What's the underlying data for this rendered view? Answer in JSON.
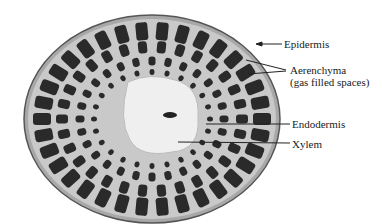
{
  "figure": {
    "labels": [
      {
        "id": "epidermis",
        "text": "Epidermis"
      },
      {
        "id": "aerenchyma",
        "text": "Aerenchyma"
      },
      {
        "id": "aerenchyma_note",
        "text": "(gas filled spaces)"
      },
      {
        "id": "endodermis",
        "text": "Endodermis"
      },
      {
        "id": "xylem",
        "text": "Xylem"
      }
    ]
  }
}
